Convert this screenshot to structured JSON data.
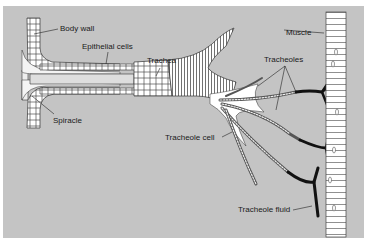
{
  "figure": {
    "background_color": "#c4c4c4",
    "labels": {
      "body_wall": "Body wall",
      "epithelial_cells": "Epithelial cells",
      "trachea": "Trachea",
      "spiracle": "Spiracle",
      "tracheole_cell": "Tracheole cell",
      "tracheoles": "Tracheoles",
      "muscle": "Muscle",
      "tracheole_fluid": "Tracheole fluid"
    }
  }
}
